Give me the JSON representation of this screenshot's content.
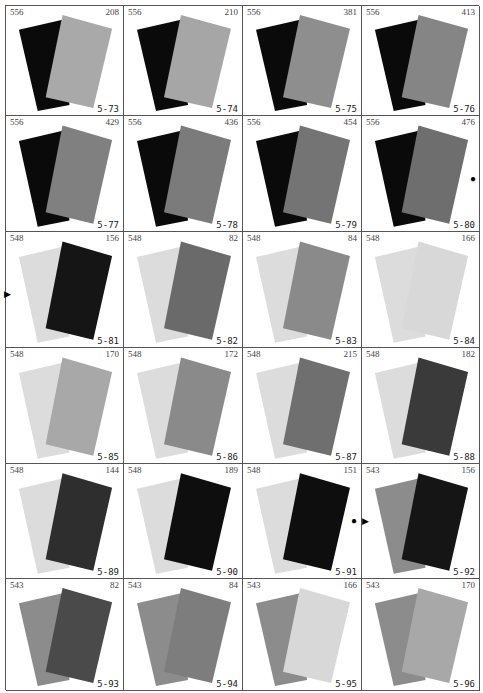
{
  "plates": [
    {
      "left": "556",
      "right": "208",
      "label": "5-73",
      "back": "#0a0a0a",
      "front": "#a9a9a9"
    },
    {
      "left": "556",
      "right": "210",
      "label": "5-74",
      "back": "#0a0a0a",
      "front": "#a6a6a6"
    },
    {
      "left": "556",
      "right": "381",
      "label": "5-75",
      "back": "#0a0a0a",
      "front": "#8e8e8e"
    },
    {
      "left": "556",
      "right": "413",
      "label": "5-76",
      "back": "#0a0a0a",
      "front": "#858585"
    },
    {
      "left": "556",
      "right": "429",
      "label": "5-77",
      "back": "#0a0a0a",
      "front": "#808080"
    },
    {
      "left": "556",
      "right": "436",
      "label": "5-78",
      "back": "#0a0a0a",
      "front": "#7b7b7b"
    },
    {
      "left": "556",
      "right": "454",
      "label": "5-79",
      "back": "#0a0a0a",
      "front": "#747474"
    },
    {
      "left": "556",
      "right": "476",
      "label": "5-80",
      "back": "#0a0a0a",
      "front": "#6e6e6e"
    },
    {
      "left": "548",
      "right": "156",
      "label": "5-81",
      "back": "#dcdcdc",
      "front": "#151515"
    },
    {
      "left": "548",
      "right": "82",
      "label": "5-82",
      "back": "#dcdcdc",
      "front": "#6a6a6a"
    },
    {
      "left": "548",
      "right": "84",
      "label": "5-83",
      "back": "#dcdcdc",
      "front": "#8a8a8a"
    },
    {
      "left": "548",
      "right": "166",
      "label": "5-84",
      "back": "#dcdcdc",
      "front": "#d8d8d8"
    },
    {
      "left": "548",
      "right": "170",
      "label": "5-85",
      "back": "#dcdcdc",
      "front": "#a8a8a8"
    },
    {
      "left": "548",
      "right": "172",
      "label": "5-86",
      "back": "#dcdcdc",
      "front": "#8a8a8a"
    },
    {
      "left": "548",
      "right": "215",
      "label": "5-87",
      "back": "#dcdcdc",
      "front": "#6f6f6f"
    },
    {
      "left": "548",
      "right": "182",
      "label": "5-88",
      "back": "#dcdcdc",
      "front": "#3a3a3a"
    },
    {
      "left": "548",
      "right": "144",
      "label": "5-89",
      "back": "#dcdcdc",
      "front": "#2e2e2e"
    },
    {
      "left": "548",
      "right": "189",
      "label": "5-90",
      "back": "#dcdcdc",
      "front": "#0e0e0e"
    },
    {
      "left": "548",
      "right": "151",
      "label": "5-91",
      "back": "#dcdcdc",
      "front": "#0e0e0e"
    },
    {
      "left": "543",
      "right": "156",
      "label": "5-92",
      "back": "#8c8c8c",
      "front": "#151515"
    },
    {
      "left": "543",
      "right": "82",
      "label": "5-93",
      "back": "#8c8c8c",
      "front": "#4a4a4a"
    },
    {
      "left": "543",
      "right": "84",
      "label": "5-94",
      "back": "#8c8c8c",
      "front": "#7d7d7d"
    },
    {
      "left": "543",
      "right": "166",
      "label": "5-95",
      "back": "#8c8c8c",
      "front": "#d8d8d8"
    },
    {
      "left": "543",
      "right": "170",
      "label": "5-96",
      "back": "#8c8c8c",
      "front": "#a8a8a8"
    }
  ],
  "markers": {
    "circle": "●",
    "triangle": "▶"
  }
}
